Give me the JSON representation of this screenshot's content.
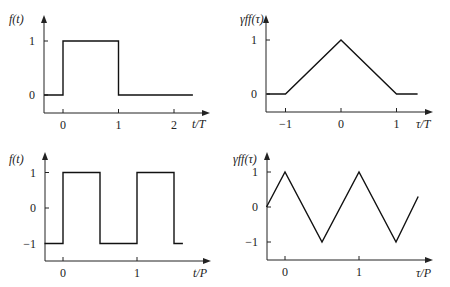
{
  "chart_data": [
    {
      "id": "p1",
      "type": "line",
      "title": "",
      "ylabel": "f(t)",
      "xlabel": "t/T",
      "xticks": [
        0,
        1,
        2
      ],
      "xtick_labels": [
        "0",
        "1",
        "2"
      ],
      "yticks": [
        0,
        1
      ],
      "ytick_labels": [
        "0",
        "1"
      ],
      "xlim": [
        -0.34,
        2.6
      ],
      "ylim": [
        -0.33,
        1.0
      ],
      "grid": false,
      "legend": null,
      "x": [
        -0.34,
        0,
        0,
        1,
        1,
        2.34
      ],
      "y": [
        0,
        0,
        1,
        1,
        0,
        0
      ],
      "description": "Single rectangular pulse of height 1 from t=0 to t=T"
    },
    {
      "id": "p2",
      "type": "line",
      "title": "",
      "ylabel": "γff(τ)",
      "xlabel": "τ/T",
      "xticks": [
        -1,
        0,
        1
      ],
      "xtick_labels": [
        "−1",
        "0",
        "1"
      ],
      "yticks": [
        0,
        1
      ],
      "ytick_labels": [
        "0",
        "1"
      ],
      "xlim": [
        -1.34,
        1.66
      ],
      "ylim": [
        -0.33,
        1.0
      ],
      "grid": false,
      "legend": null,
      "x": [
        -1.34,
        -1,
        0,
        1,
        1.38
      ],
      "y": [
        0,
        0,
        1,
        0,
        0
      ],
      "description": "Triangular autocorrelation of the rectangular pulse"
    },
    {
      "id": "p3",
      "type": "line",
      "title": "",
      "ylabel": "f(t)",
      "xlabel": "t/P",
      "xticks": [
        0,
        1
      ],
      "xtick_labels": [
        "0",
        "1"
      ],
      "yticks": [
        -1,
        0,
        1
      ],
      "ytick_labels": [
        "−1",
        "0",
        "1"
      ],
      "xlim": [
        -0.25,
        2.0
      ],
      "ylim": [
        -1.5,
        1.0
      ],
      "grid": false,
      "legend": null,
      "x": [
        -0.25,
        0,
        0,
        0.5,
        0.5,
        1,
        1,
        1.5,
        1.5,
        1.62
      ],
      "y": [
        -1,
        -1,
        1,
        1,
        -1,
        -1,
        1,
        1,
        -1,
        -1
      ],
      "description": "Periodic square wave between +1 and −1 with period P"
    },
    {
      "id": "p4",
      "type": "line",
      "title": "",
      "ylabel": "γff(τ)",
      "xlabel": "τ/P",
      "xticks": [
        0,
        1
      ],
      "xtick_labels": [
        "0",
        "1"
      ],
      "yticks": [
        -1,
        0,
        1
      ],
      "ytick_labels": [
        "−1",
        "0",
        "1"
      ],
      "xlim": [
        -0.25,
        2.0
      ],
      "ylim": [
        -1.5,
        1.0
      ],
      "grid": false,
      "legend": null,
      "x": [
        -0.25,
        0,
        0.5,
        1,
        1.5,
        1.8
      ],
      "y": [
        0,
        1,
        -1,
        1,
        -1,
        0.3
      ],
      "description": "Periodic triangular autocorrelation of the square wave"
    }
  ],
  "panels": [
    {
      "id": "p1",
      "box": {
        "axis_x": 44,
        "x_axis_y": 113,
        "x_end": 210,
        "y_top": 15
      },
      "map": {
        "x0_px": 63,
        "x_unit_px": 55.5,
        "y0_px": 95,
        "y_unit_px": 54
      },
      "ylabel_pos": [
        9,
        23
      ],
      "xlabel_pos": [
        192,
        128
      ]
    },
    {
      "id": "p2",
      "box": {
        "axis_x": 266,
        "x_axis_y": 112,
        "x_end": 433,
        "y_top": 15
      },
      "map": {
        "x0_px": 341,
        "x_unit_px": 55.5,
        "y0_px": 94,
        "y_unit_px": 54
      },
      "ylabel_pos": [
        240,
        23
      ],
      "xlabel_pos": [
        416,
        128
      ]
    },
    {
      "id": "p3",
      "box": {
        "axis_x": 45,
        "x_axis_y": 261,
        "x_end": 211,
        "y_top": 152
      },
      "map": {
        "x0_px": 63,
        "x_unit_px": 74,
        "y0_px": 208,
        "y_unit_px": 35.5
      },
      "ylabel_pos": [
        9,
        163
      ],
      "xlabel_pos": [
        193,
        277
      ]
    },
    {
      "id": "p4",
      "box": {
        "axis_x": 267,
        "x_axis_y": 260,
        "x_end": 433,
        "y_top": 152
      },
      "map": {
        "x0_px": 285,
        "x_unit_px": 74,
        "y0_px": 207,
        "y_unit_px": 35
      },
      "ylabel_pos": [
        233,
        163
      ],
      "xlabel_pos": [
        416,
        277
      ]
    }
  ]
}
